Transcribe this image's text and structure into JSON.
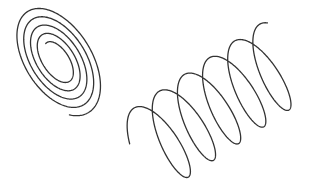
{
  "figure": {
    "width": 312,
    "height": 179,
    "background": "#ffffff",
    "stroke_color": "#333333",
    "stroke_width": 1.3
  },
  "shapes": [
    {
      "name": "planar-spiral",
      "kind": "spiral",
      "center": [
        57,
        60
      ],
      "rotation_deg": -32,
      "turns": 4.6,
      "start_angle_deg": -95,
      "inner_radii": [
        10,
        20
      ],
      "outer_radii": [
        36,
        62
      ]
    },
    {
      "name": "helix-coil",
      "kind": "helix",
      "start": [
        150,
        150
      ],
      "end": [
        282,
        62
      ],
      "loops": 5.25,
      "loop_rx": 16,
      "loop_ry": 44,
      "loop_tilt_deg": -28,
      "phase_deg": 200
    }
  ]
}
